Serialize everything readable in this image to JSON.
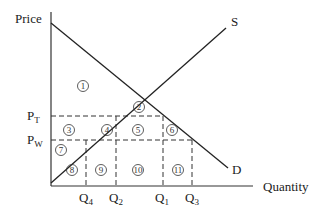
{
  "diagram": {
    "type": "supply-demand tariff diagram",
    "axis_labels": {
      "y": "Price",
      "x": "Quantity"
    },
    "curves": {
      "supply": "S",
      "demand": "D"
    },
    "price_levels": [
      {
        "main": "P",
        "sub": "T"
      },
      {
        "main": "P",
        "sub": "W"
      }
    ],
    "quantity_levels": [
      {
        "main": "Q",
        "sub": "4"
      },
      {
        "main": "Q",
        "sub": "2"
      },
      {
        "main": "Q",
        "sub": "1"
      },
      {
        "main": "Q",
        "sub": "3"
      }
    ],
    "regions": [
      "1",
      "2",
      "3",
      "4",
      "5",
      "6",
      "7",
      "8",
      "9",
      "10",
      "11"
    ],
    "colors": {
      "line": "#222222",
      "background": "#ffffff"
    }
  }
}
